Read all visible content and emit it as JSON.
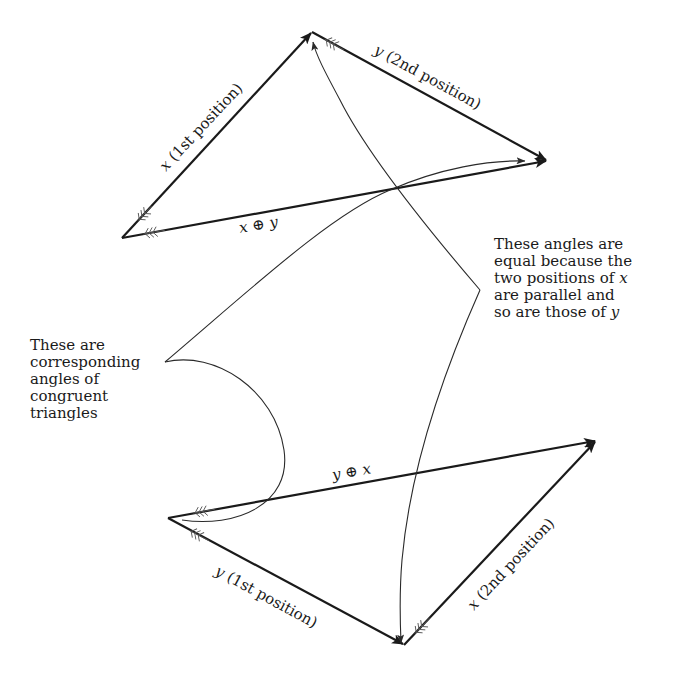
{
  "figure": {
    "top_triangle": {
      "vertices": {
        "start": [
          122,
          238
        ],
        "apex": [
          312,
          32
        ],
        "end": [
          547,
          161
        ]
      },
      "labels": {
        "x_first": {
          "var": "x",
          "text": " (1st position)"
        },
        "y_second": {
          "var": "y",
          "text": " (2nd position)"
        },
        "sum": {
          "left": "x",
          "op": "⊕",
          "right": "y"
        }
      }
    },
    "bottom_triangle": {
      "vertices": {
        "start": [
          168,
          518
        ],
        "apex": [
          404,
          645
        ],
        "end": [
          596,
          441
        ]
      },
      "labels": {
        "y_first": {
          "var": "y",
          "text": " (1st position)"
        },
        "x_second": {
          "var": "x",
          "text": " (2nd position)"
        },
        "sum": {
          "left": "y",
          "op": "⊕",
          "right": "x"
        }
      }
    },
    "notes": {
      "left": {
        "lines": [
          "These are",
          "corresponding",
          "angles of",
          "congruent",
          "triangles"
        ]
      },
      "right": {
        "lines": [
          "These angles are",
          "equal because the",
          "two positions of ",
          "are parallel and",
          "so are those of "
        ],
        "line3_var": "x",
        "line5_var": "y"
      }
    },
    "colors": {
      "ink": "#1a1a1a",
      "background": "#ffffff"
    }
  }
}
